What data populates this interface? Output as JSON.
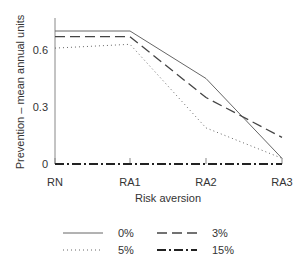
{
  "chart_data": {
    "type": "line",
    "title": "",
    "xlabel": "Risk aversion",
    "ylabel": "Prevention – mean annual units",
    "categories": [
      "RN",
      "RA1",
      "RA2",
      "RA3"
    ],
    "yticks": [
      "0",
      "0.3",
      "0.6"
    ],
    "ylim": [
      0,
      0.72
    ],
    "grid": false,
    "legend_position": "bottom",
    "series": [
      {
        "name": "0%",
        "style": "solid",
        "values": [
          0.7,
          0.7,
          0.45,
          0.03
        ]
      },
      {
        "name": "3%",
        "style": "dashed",
        "values": [
          0.67,
          0.67,
          0.35,
          0.14
        ]
      },
      {
        "name": "5%",
        "style": "dotted",
        "values": [
          0.61,
          0.63,
          0.19,
          0.03
        ]
      },
      {
        "name": "15%",
        "style": "dash-dot",
        "values": [
          0.0,
          0.0,
          0.0,
          0.0
        ]
      }
    ]
  },
  "legend": [
    "0%",
    "3%",
    "5%",
    "15%"
  ]
}
